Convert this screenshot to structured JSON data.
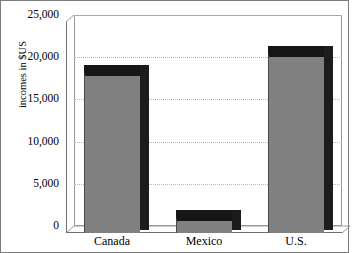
{
  "chart_data": {
    "type": "bar",
    "title": "",
    "subtitle": "",
    "xlabel": "",
    "ylabel": "incomes in $US",
    "categories": [
      "Canada",
      "Mexico",
      "U.S."
    ],
    "values": [
      19200,
      2000,
      21500
    ],
    "series": [
      {
        "name": "incomes in $US",
        "values": [
          19200,
          2000,
          21500
        ]
      }
    ],
    "ylim": [
      0,
      25000
    ],
    "yticks": [
      0,
      5000,
      10000,
      15000,
      20000,
      25000
    ],
    "ytick_labels": [
      "0",
      "5,000",
      "10,000",
      "15,000",
      "20,000",
      "25,000"
    ],
    "grid": true,
    "grid_axis": "y",
    "legend": false,
    "legend_position": "none",
    "three_d": true,
    "colors": {
      "bar_face": "#808080",
      "bar_side": "#1c1c1c",
      "bar_top": "#161616",
      "gridline": "#b5b5b5",
      "axis": "#6f6f6f",
      "background": "#ffffff",
      "text": "#000000",
      "frame": "#7d7d7d"
    }
  }
}
